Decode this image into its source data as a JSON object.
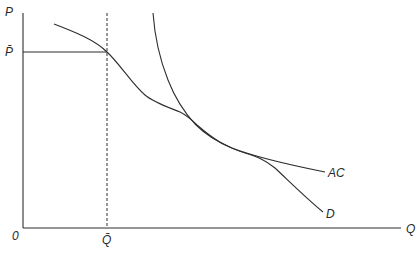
{
  "diagram": {
    "type": "economics-cost-demand",
    "axes": {
      "y_label": "P",
      "x_label": "Q",
      "origin_label": "0"
    },
    "markers": {
      "price_label": "P̄",
      "quantity_label": "Q̄"
    },
    "curves": [
      {
        "name": "demand",
        "label": "D"
      },
      {
        "name": "average-cost",
        "label": "AC"
      }
    ],
    "colors": {
      "line": "#2e2e2e",
      "background": "#ffffff"
    }
  }
}
